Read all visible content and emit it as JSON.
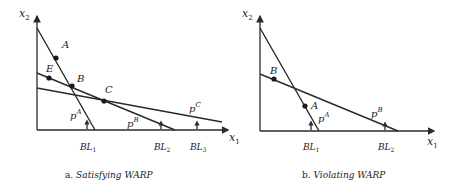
{
  "panels": [
    {
      "id": "a",
      "caption_prefix": "a.",
      "caption_text": "Satisfying WARP",
      "axes": {
        "x_label": "x",
        "x_sub": "1",
        "y_label": "x",
        "y_sub": "2"
      },
      "budget_lines": [
        {
          "name": "pA",
          "price_label": "p",
          "price_sup": "A",
          "marker": "BL",
          "marker_sub": "1"
        },
        {
          "name": "pB",
          "price_label": "p",
          "price_sup": "B",
          "marker": "BL",
          "marker_sub": "2"
        },
        {
          "name": "pC",
          "price_label": "p",
          "price_sup": "C",
          "marker": "BL",
          "marker_sub": "3"
        }
      ],
      "points": [
        {
          "label": "A"
        },
        {
          "label": "E"
        },
        {
          "label": "B"
        },
        {
          "label": "C"
        }
      ]
    },
    {
      "id": "b",
      "caption_prefix": "b.",
      "caption_text": "Violating WARP",
      "axes": {
        "x_label": "x",
        "x_sub": "1",
        "y_label": "x",
        "y_sub": "2"
      },
      "budget_lines": [
        {
          "name": "pA",
          "price_label": "p",
          "price_sup": "A",
          "marker": "BL",
          "marker_sub": "1"
        },
        {
          "name": "pB",
          "price_label": "p",
          "price_sup": "B",
          "marker": "BL",
          "marker_sub": "2"
        }
      ],
      "points": [
        {
          "label": "B"
        },
        {
          "label": "A"
        }
      ]
    }
  ]
}
